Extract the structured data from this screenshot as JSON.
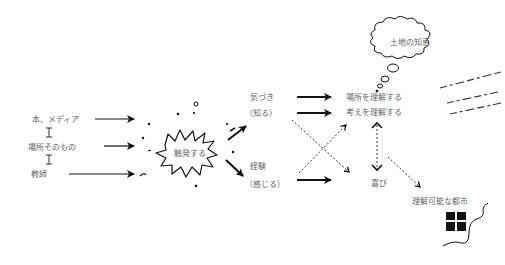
{
  "sources": [
    {
      "label": "本、メディア"
    },
    {
      "label": "場所そのもの"
    },
    {
      "label": "教師"
    }
  ],
  "trigger": {
    "label": "触発する"
  },
  "middle": {
    "awareness": {
      "label": "気づき",
      "sub": "（知る）"
    },
    "experience": {
      "label": "経験",
      "sub": "（感じる）"
    }
  },
  "outcomes": {
    "understand_place": "場所を理解する",
    "understand_idea": "考えを理解する",
    "joy": "喜び"
  },
  "thought_bubble": {
    "label": "土地の知恵"
  },
  "result": {
    "label": "理解可能な都市"
  },
  "colors": {
    "ink": "#111111",
    "text": "#666666",
    "background": "#ffffff"
  }
}
